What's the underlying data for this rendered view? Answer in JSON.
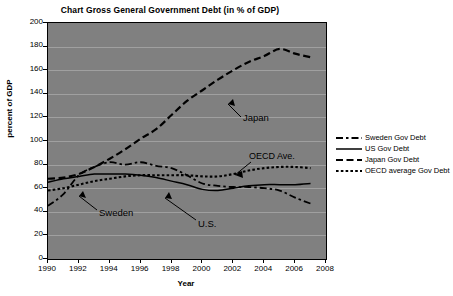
{
  "chart_data": {
    "type": "line",
    "title": "Chart Gross General Government Debt (in % of GDP)",
    "xlabel": "Year",
    "ylabel": "percent of GDP",
    "xlim": [
      1990,
      2008
    ],
    "ylim": [
      0,
      200
    ],
    "x_ticks": [
      "1990",
      "1992",
      "1994",
      "1996",
      "1998",
      "2000",
      "2002",
      "2004",
      "2006",
      "2008"
    ],
    "y_ticks": [
      "0",
      "20",
      "40",
      "60",
      "80",
      "100",
      "120",
      "140",
      "160",
      "180",
      "200"
    ],
    "grid": "horizontal",
    "plot_background": "#808080",
    "legend_position": "right",
    "x": [
      1990,
      1991,
      1992,
      1993,
      1994,
      1995,
      1996,
      1997,
      1998,
      1999,
      2000,
      2001,
      2002,
      2003,
      2004,
      2005,
      2006,
      2007
    ],
    "series": [
      {
        "name": "Sweden Gov Debt",
        "style": "dash-dot",
        "color": "#000000",
        "values": [
          45,
          55,
          71,
          78,
          82,
          80,
          82,
          79,
          77,
          71,
          64,
          62,
          61,
          61,
          60,
          58,
          52,
          47
        ]
      },
      {
        "name": "US Gov Debt",
        "style": "solid",
        "color": "#000000",
        "values": [
          65,
          68,
          70,
          72,
          72,
          72,
          71,
          69,
          66,
          63,
          59,
          58,
          60,
          62,
          63,
          63,
          63,
          64
        ]
      },
      {
        "name": "Japan Gov Debt",
        "style": "long-dash",
        "color": "#000000",
        "values": [
          68,
          69,
          72,
          78,
          85,
          93,
          102,
          110,
          122,
          134,
          143,
          152,
          160,
          167,
          172,
          178,
          174,
          171
        ]
      },
      {
        "name": "OECD average Gov Debt",
        "style": "dotted",
        "color": "#000000",
        "values": [
          58,
          60,
          63,
          66,
          68,
          70,
          71,
          71,
          71,
          71,
          70,
          70,
          72,
          75,
          77,
          78,
          78,
          77
        ]
      }
    ],
    "annotations": [
      {
        "key": "sweden",
        "text": "Sweden"
      },
      {
        "key": "us",
        "text": "U.S."
      },
      {
        "key": "japan",
        "text": "Japan"
      },
      {
        "key": "oecd",
        "text": "OECD Ave."
      }
    ]
  },
  "legend": {
    "items": [
      {
        "label": "Sweden Gov Debt",
        "style": "dash-dot"
      },
      {
        "label": "US Gov Debt",
        "style": "solid"
      },
      {
        "label": "Japan Gov Debt",
        "style": "long-dash"
      },
      {
        "label": "OECD average Gov Debt",
        "style": "dotted"
      }
    ]
  }
}
